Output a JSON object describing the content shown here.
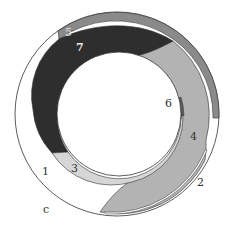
{
  "diagram": {
    "type": "nested-circle-region-diagram",
    "regions": [
      {
        "id": "1",
        "label": "1",
        "fill": "#ffffff",
        "description": "left white crescent"
      },
      {
        "id": "2",
        "label": "2",
        "fill": "#ffffff",
        "description": "thin white sliver on lower-right outer edge"
      },
      {
        "id": "3",
        "label": "3",
        "fill": "#d4d4d4",
        "description": "light band around lower inner hole"
      },
      {
        "id": "4",
        "label": "4",
        "fill": "#b3b3b3",
        "description": "large right gray crescent"
      },
      {
        "id": "5",
        "label": "5",
        "fill": "#8a8a8a",
        "description": "thin medium-gray band along top outer edge"
      },
      {
        "id": "6",
        "label": "6",
        "fill": "#5a5a5a",
        "description": "thin dark strip at inner right"
      },
      {
        "id": "7",
        "label": "7",
        "fill": "#2e2e2e",
        "description": "large dark crescent upper-left"
      }
    ],
    "outer_label": "c",
    "colors": {
      "stroke": "#333333",
      "background": "#ffffff"
    }
  }
}
